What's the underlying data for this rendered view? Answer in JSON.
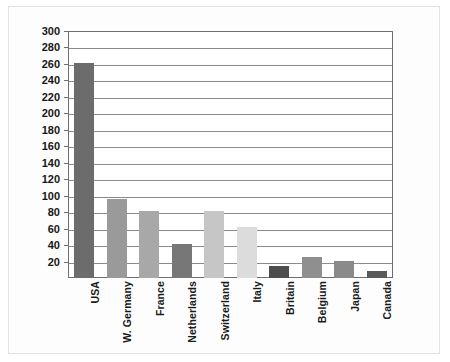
{
  "chart_data": {
    "type": "bar",
    "title": "",
    "subtitle": "",
    "xlabel": "",
    "ylabel": "",
    "categories": [
      "USA",
      "W. Germany",
      "France",
      "Netherlands",
      "Switzerland",
      "Italy",
      "Britain",
      "Belgium",
      "Japan",
      "Canada"
    ],
    "values": [
      261,
      96,
      81,
      41,
      81,
      62,
      14,
      25,
      21,
      8
    ],
    "bar_colors": [
      "#6c6c6c",
      "#9a9a9a",
      "#a8a8a8",
      "#777777",
      "#c6c6c6",
      "#dcdcdc",
      "#4d4d4d",
      "#8f8f8f",
      "#8a8a8a",
      "#5a5a5a"
    ],
    "ylim": [
      0,
      300
    ],
    "ytick_step": 20,
    "yticks": [
      20,
      40,
      60,
      80,
      100,
      120,
      140,
      160,
      180,
      200,
      220,
      240,
      260,
      280,
      300
    ],
    "ytick_labels": [
      "20",
      "40",
      "60",
      "80",
      "100",
      "120",
      "140",
      "160",
      "180",
      "200",
      "220",
      "240",
      "260",
      "280",
      "300"
    ],
    "grid": true,
    "grid_axis": "y",
    "legend": false,
    "legend_position": "none",
    "annotations": [],
    "axis_line_color": "#6f6f6f",
    "grid_color": "#8a8a8a",
    "background_color": "#ffffff"
  },
  "figure": {
    "border_color": "#e3e3e3",
    "canvas_color": "#fdfdfd"
  }
}
